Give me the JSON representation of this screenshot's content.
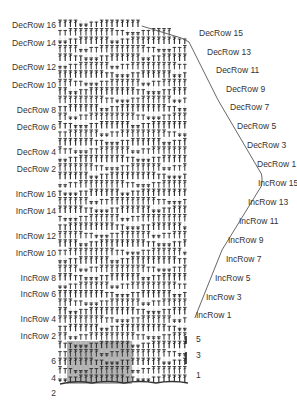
{
  "diagram": {
    "type": "crochet-stitch-chart",
    "colors": {
      "stitch": "#2a2a2a",
      "grid": "#c8c8c8",
      "shade": "#9a9a9a",
      "text": "#333333"
    },
    "left_labels": [
      {
        "text": "DecRow 16",
        "y": 28
      },
      {
        "text": "DecRow 14",
        "y": 46
      },
      {
        "text": "DecRow 12",
        "y": 70
      },
      {
        "text": "DecRow 10",
        "y": 88
      },
      {
        "text": "DecRow 8",
        "y": 113
      },
      {
        "text": "DecRow 6",
        "y": 130
      },
      {
        "text": "DecRow 4",
        "y": 155
      },
      {
        "text": "DecRow 2",
        "y": 172
      },
      {
        "text": "IncRow 16",
        "y": 197
      },
      {
        "text": "IncRow 14",
        "y": 214
      },
      {
        "text": "IncRow 12",
        "y": 239
      },
      {
        "text": "IncRow 10",
        "y": 256
      },
      {
        "text": "IncRow 8",
        "y": 281
      },
      {
        "text": "IncRow 6",
        "y": 297
      },
      {
        "text": "IncRow 4",
        "y": 322
      },
      {
        "text": "IncRow 2",
        "y": 339
      },
      {
        "text": "6",
        "y": 364
      },
      {
        "text": "4",
        "y": 381
      },
      {
        "text": "2",
        "y": 396
      }
    ],
    "right_labels": [
      {
        "text": "DecRow 15",
        "x": 199,
        "y": 36
      },
      {
        "text": "DecRow 13",
        "x": 207,
        "y": 55
      },
      {
        "text": "DecRow 11",
        "x": 216,
        "y": 73
      },
      {
        "text": "DecRow 9",
        "x": 226,
        "y": 92
      },
      {
        "text": "DecRow 7",
        "x": 230,
        "y": 110
      },
      {
        "text": "DecRow 5",
        "x": 237,
        "y": 129
      },
      {
        "text": "DecRow 3",
        "x": 247,
        "y": 148
      },
      {
        "text": "DecRow 1",
        "x": 257,
        "y": 167
      },
      {
        "text": "IncRow 15",
        "x": 258,
        "y": 186
      },
      {
        "text": "IncRow 13",
        "x": 248,
        "y": 205
      },
      {
        "text": "IncRow 11",
        "x": 239,
        "y": 224
      },
      {
        "text": "IncRow 9",
        "x": 228,
        "y": 243
      },
      {
        "text": "IncRow 7",
        "x": 226,
        "y": 262
      },
      {
        "text": "IncRow 5",
        "x": 215,
        "y": 281
      },
      {
        "text": "IncRow 3",
        "x": 206,
        "y": 300
      },
      {
        "text": "IncRow 1",
        "x": 196,
        "y": 318
      },
      {
        "text": "5",
        "x": 196,
        "y": 342
      },
      {
        "text": "3",
        "x": 196,
        "y": 358
      },
      {
        "text": "1",
        "x": 196,
        "y": 378
      }
    ]
  }
}
